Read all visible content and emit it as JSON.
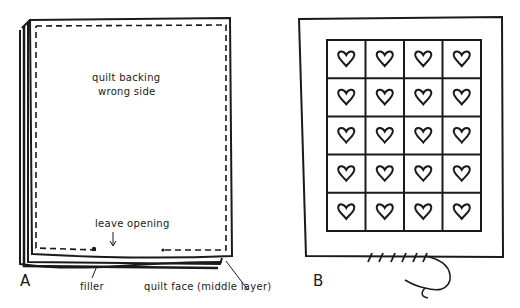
{
  "figure": {
    "panels": [
      {
        "id": "A",
        "letter": "A",
        "labels": {
          "backing_line1": "quilt backing",
          "backing_line2": "wrong side",
          "opening": "leave opening",
          "filler": "filler",
          "face": "quilt face (middle layer)"
        }
      },
      {
        "id": "B",
        "letter": "B",
        "grid": {
          "rows": 5,
          "cols": 4,
          "motif": "heart"
        }
      }
    ],
    "colors": {
      "ink": "#1a1a1a",
      "background": "#ffffff"
    }
  }
}
